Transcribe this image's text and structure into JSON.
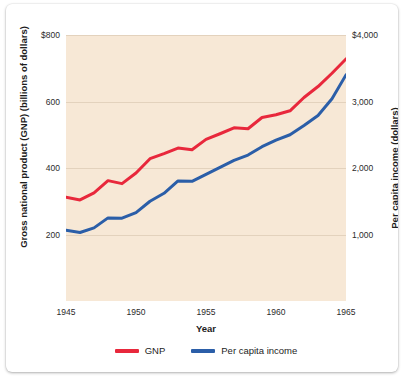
{
  "chart_data": {
    "type": "line",
    "title": "",
    "xlabel": "Year",
    "ylabel": "Gross national product (GNP) (billions of dollars)",
    "y2label": "Per capita income (dollars)",
    "xlim": [
      1945,
      1965
    ],
    "ylim": [
      0,
      800
    ],
    "y2lim": [
      0,
      4000
    ],
    "grid": true,
    "legend_position": "bottom",
    "xticks": [
      "1945",
      "1950",
      "1955",
      "1960",
      "1965"
    ],
    "xtick_values": [
      1945,
      1950,
      1955,
      1960,
      1965
    ],
    "yticks": [
      "$800",
      "600",
      "400",
      "200"
    ],
    "ytick_values": [
      800,
      600,
      400,
      200
    ],
    "y2ticks": [
      "$4,000",
      "3,000",
      "2,000",
      "1,000"
    ],
    "y2tick_values": [
      4000,
      3000,
      2000,
      1000
    ],
    "x": [
      1945,
      1946,
      1947,
      1948,
      1949,
      1950,
      1951,
      1952,
      1953,
      1954,
      1955,
      1956,
      1957,
      1958,
      1959,
      1960,
      1961,
      1962,
      1963,
      1964,
      1965
    ],
    "series": [
      {
        "name": "GNP",
        "axis": "left",
        "color": "#e8283c",
        "values": [
          312,
          304,
          325,
          362,
          353,
          385,
          428,
          443,
          460,
          455,
          486,
          503,
          521,
          518,
          552,
          560,
          572,
          612,
          645,
          685,
          728
        ]
      },
      {
        "name": "Per capita income",
        "axis": "right",
        "color": "#2b5ea8",
        "values": [
          1065,
          1030,
          1100,
          1250,
          1245,
          1330,
          1500,
          1620,
          1805,
          1800,
          1905,
          2010,
          2115,
          2195,
          2320,
          2420,
          2500,
          2640,
          2790,
          3040,
          3400
        ]
      }
    ]
  },
  "axes": {
    "x_title": "Year",
    "y_left_title": "Gross national product (GNP) (billions of dollars)",
    "y_right_title": "Per capita income (dollars)"
  },
  "legend": {
    "items": [
      {
        "label": "GNP",
        "color": "#e8283c"
      },
      {
        "label": "Per capita income",
        "color": "#2b5ea8"
      }
    ]
  },
  "colors": {
    "plot_background": "#f7e8d6",
    "gridline": "#e3d2bd",
    "card_background": "#ffffff",
    "gnp_line": "#e8283c",
    "per_capita_line": "#2b5ea8",
    "text": "#1d1d1d"
  }
}
